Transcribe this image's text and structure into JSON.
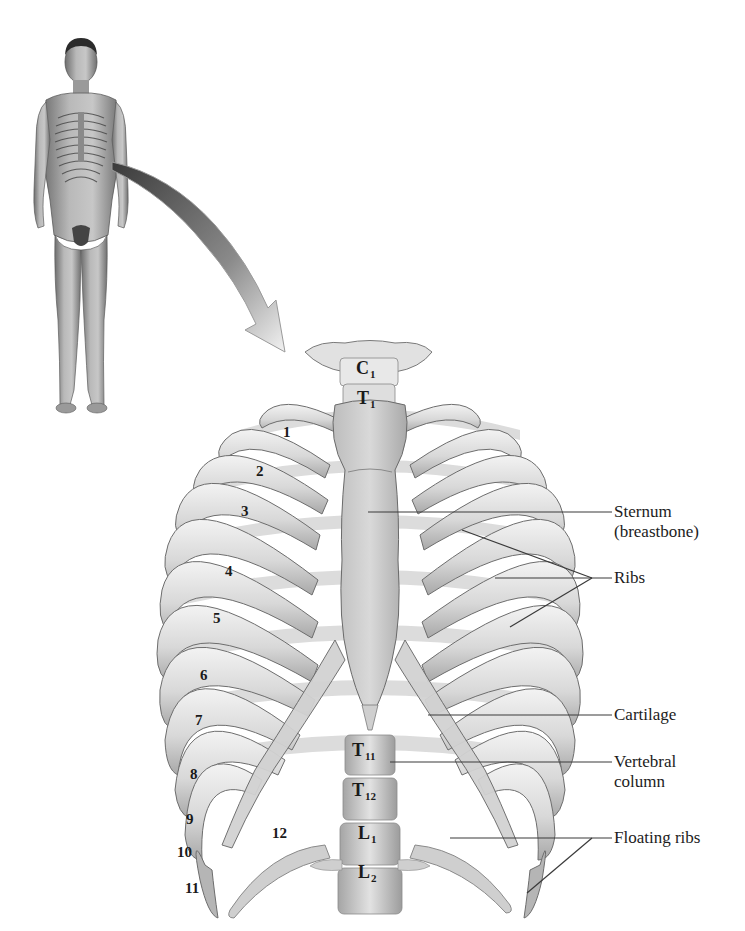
{
  "figure": {
    "inset": "Full-body male figure with rib cage highlighted, arrow pointing to enlarged view"
  },
  "labels": {
    "sternum_line1": "Sternum",
    "sternum_line2": "(breastbone)",
    "ribs": "Ribs",
    "cartilage": "Cartilage",
    "vertebral_line1": "Vertebral",
    "vertebral_line2": "column",
    "floating_ribs": "Floating ribs"
  },
  "rib_numbers": [
    "1",
    "2",
    "3",
    "4",
    "5",
    "6",
    "7",
    "8",
    "9",
    "10",
    "11",
    "12"
  ],
  "vertebrae": [
    {
      "letter": "C",
      "sub": "1"
    },
    {
      "letter": "T",
      "sub": "1"
    },
    {
      "letter": "T",
      "sub": "11"
    },
    {
      "letter": "T",
      "sub": "12"
    },
    {
      "letter": "L",
      "sub": "1"
    },
    {
      "letter": "L",
      "sub": "2"
    }
  ],
  "colors": {
    "bone_light": "#e6e6e6",
    "bone_mid": "#c4c4c4",
    "bone_shadow": "#9a9a9a",
    "outline": "#6d6d6d",
    "leader_line": "#3a3a3a",
    "text": "#1c1c1c",
    "background": "#ffffff"
  }
}
